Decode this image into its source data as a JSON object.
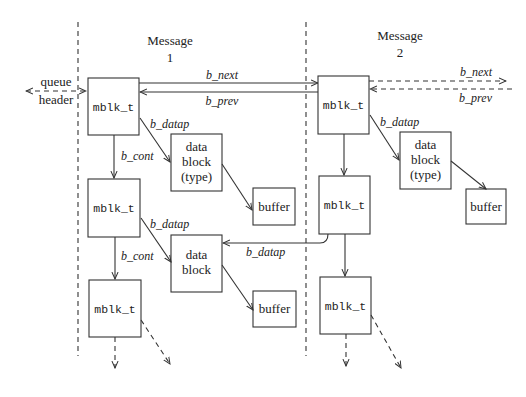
{
  "diagram": {
    "messages": [
      {
        "title_line1": "Message",
        "title_line2": "1"
      },
      {
        "title_line1": "Message",
        "title_line2": "2"
      }
    ],
    "queue_header": {
      "line1": "queue",
      "line2": "header"
    },
    "mblk_label": "mblk_t",
    "data_block_typed": {
      "line1": "data",
      "line2": "block",
      "line3": "(type)"
    },
    "data_block": {
      "line1": "data",
      "line2": "block"
    },
    "buffer_label": "buffer",
    "pointers": {
      "b_next": "b_next",
      "b_prev": "b_prev",
      "b_datap": "b_datap",
      "b_cont": "b_cont"
    }
  }
}
